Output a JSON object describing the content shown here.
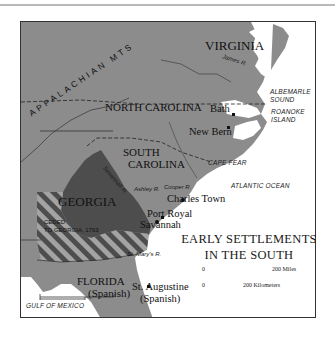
{
  "map": {
    "title_line1": "EARLY SETTLEMENTS",
    "title_line2": "IN THE SOUTH",
    "colors": {
      "land": "#8c8c8c",
      "georgia": "#4d4d4d",
      "ocean": "#ffffff",
      "border": "#333333",
      "stripe_light": "#a3a3a3",
      "stripe_dark": "#4d4d4d"
    },
    "regions": {
      "virginia": "VIRGINIA",
      "north_carolina": "NORTH CAROLINA",
      "south_carolina_1": "SOUTH",
      "south_carolina_2": "CAROLINA",
      "georgia": "GEORGIA",
      "ceded_1": "CEDED",
      "ceded_2": "TO GEORGIA, 1763",
      "florida": "FLORIDA",
      "florida_sub": "(Spanish)",
      "mountains": "APPALACHIAN MTS"
    },
    "settlements": {
      "bath": "Bath",
      "new_bern": "New Bern",
      "charles_town": "Charles Town",
      "port_royal": "Port Royal",
      "savannah": "Savannah",
      "st_augustine": "St. Augustine",
      "st_augustine_sub": "(Spanish)"
    },
    "water": {
      "albemarle_1": "ALBEMARLE",
      "albemarle_2": "SOUND",
      "roanoke_1": "ROANOKE",
      "roanoke_2": "ISLAND",
      "cape_fear": "CAPE FEAR",
      "atlantic": "ATLANTIC OCEAN",
      "gulf": "GULF OF MEXICO"
    },
    "rivers": {
      "james": "James R.",
      "savannah": "Savannah R.",
      "ashley": "Ashley R.",
      "cooper": "Cooper R.",
      "st_marys": "St. Mary's R."
    },
    "scale": {
      "zero_top": "0",
      "miles": "200 Miles",
      "zero_bottom": "0",
      "km": "200 Kilometers"
    }
  }
}
